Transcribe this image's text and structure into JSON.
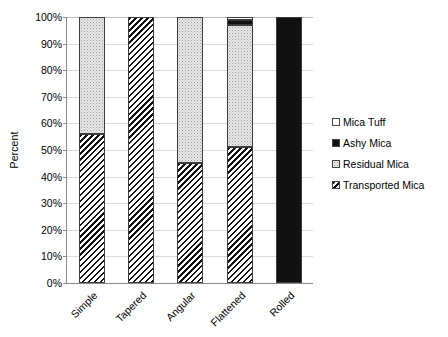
{
  "chart_data": {
    "type": "bar",
    "title": "",
    "subtitle": "",
    "xlabel": "",
    "ylabel": "Percent",
    "stacked": true,
    "stack_mode": "percent",
    "grid": true,
    "legend_position": "right",
    "ylim": [
      0,
      100
    ],
    "ytick_labels": [
      "0%",
      "10%",
      "20%",
      "30%",
      "40%",
      "50%",
      "60%",
      "70%",
      "80%",
      "90%",
      "100%"
    ],
    "ytick_values": [
      0,
      10,
      20,
      30,
      40,
      50,
      60,
      70,
      80,
      90,
      100
    ],
    "categories": [
      "Simple",
      "Tapered",
      "Angular",
      "Flattened",
      "Rolled"
    ],
    "series": [
      {
        "name": "Transported Mica",
        "pattern": "diagonal-hatch",
        "values": [
          56,
          100,
          45,
          51,
          0
        ]
      },
      {
        "name": "Residual Mica",
        "pattern": "light-stipple",
        "values": [
          44,
          0,
          55,
          46,
          0
        ]
      },
      {
        "name": "Ashy Mica",
        "pattern": "solid-black",
        "values": [
          0,
          0,
          0,
          2,
          100
        ]
      },
      {
        "name": "Mica Tuff",
        "pattern": "white",
        "values": [
          0,
          0,
          0,
          1,
          0
        ]
      }
    ],
    "stack_order_bottom_to_top": [
      "Transported Mica",
      "Residual Mica",
      "Ashy Mica",
      "Mica Tuff"
    ],
    "legend_order_top_to_bottom": [
      "Mica Tuff",
      "Ashy Mica",
      "Residual Mica",
      "Transported Mica"
    ],
    "colors": {
      "transported": "#ffffff",
      "residual": "#e8e8e8",
      "ashy": "#111111",
      "tuff": "#ffffff",
      "outline": "#3b3b3b",
      "gridline": "#d9d9d9",
      "axis": "#8a8a8a",
      "text": "#000000",
      "background": "#ffffff"
    }
  },
  "legend": {
    "items": [
      {
        "label": "Mica Tuff",
        "swatch": "white"
      },
      {
        "label": "Ashy Mica",
        "swatch": "solid-black"
      },
      {
        "label": "Residual Mica",
        "swatch": "light-stipple"
      },
      {
        "label": "Transported Mica",
        "swatch": "diagonal-hatch"
      }
    ]
  },
  "axes": {
    "y_title": "Percent"
  }
}
